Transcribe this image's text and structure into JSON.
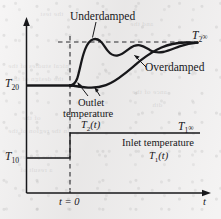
{
  "figure": {
    "axes": {
      "x_axis_label": "t",
      "y_axis_label": "",
      "x_origin_tick_label": "t = 0"
    },
    "labels": {
      "underdamped": "Underdamped",
      "overdamped": "Overdamped",
      "outlet_line1": "Outlet",
      "outlet_line2": "temperature",
      "outlet_symbol_T": "T",
      "outlet_symbol_sub": "2",
      "outlet_symbol_arg": "(t)",
      "inlet_text": "Inlet temperature",
      "inlet_symbol_T": "T",
      "inlet_symbol_sub": "1",
      "inlet_symbol_arg": "(t)",
      "T20_base": "T",
      "T20_sub": "20",
      "T10_base": "T",
      "T10_sub": "10",
      "T2inf_base": "T",
      "T2inf_sub": "2",
      "T2inf_inf": "∞",
      "T1inf_base": "T",
      "T1inf_sub": "1",
      "T1inf_inf": "∞",
      "t_axis": "t",
      "t_zero": "t = 0"
    },
    "colors": {
      "ink": "#17171a",
      "paper": "#ebeae9",
      "dashed": "#2a2a2e",
      "bleed": "#6c6c70"
    }
  },
  "chart_data": {
    "type": "line",
    "xlabel": "t",
    "ylabel": "Temperature",
    "grid": false,
    "legend": "annotations-inline",
    "xlim": [
      -0.18,
      1.0
    ],
    "ylim": [
      0,
      1.0
    ],
    "annotations": [
      {
        "text": "Underdamped",
        "points_to": "underdamped-curve-first-peak"
      },
      {
        "text": "Overdamped",
        "points_to": "overdamped-curve"
      },
      {
        "text": "Outlet temperature T2(t)",
        "points_to": "both-outlet-curves-near-t0"
      },
      {
        "text": "Inlet temperature T1(t)",
        "points_to": "inlet-step-curve"
      },
      {
        "text": "t = 0",
        "points_to": "step-time"
      },
      {
        "text": "T20",
        "points_to": "initial-outlet-temperature"
      },
      {
        "text": "T10",
        "points_to": "initial-inlet-temperature"
      },
      {
        "text": "T2∞",
        "points_to": "final-outlet-temperature"
      },
      {
        "text": "T1∞",
        "points_to": "final-inlet-temperature"
      }
    ],
    "reference_levels": [
      {
        "name": "T20",
        "value": 0.285,
        "style": "solid-left-of-step"
      },
      {
        "name": "T2inf",
        "value": 0.565,
        "style": "dashed"
      },
      {
        "name": "T10",
        "value": 0.095,
        "style": "solid"
      },
      {
        "name": "T1inf",
        "value": 0.225,
        "style": "solid"
      }
    ],
    "step_time": 0.0,
    "series": [
      {
        "name": "Inlet temperature T1(t)",
        "style": "step",
        "x": [
          -0.18,
          0.0,
          0.0,
          1.0
        ],
        "y": [
          0.095,
          0.095,
          0.225,
          0.225
        ]
      },
      {
        "name": "Underdamped outlet temperature",
        "style": "solid-thick",
        "x": [
          -0.18,
          -0.02,
          0.01,
          0.035,
          0.06,
          0.085,
          0.11,
          0.135,
          0.16,
          0.19,
          0.22,
          0.26,
          0.3,
          0.34,
          0.38,
          0.43,
          0.48,
          0.53,
          0.58,
          0.64,
          0.7,
          0.76,
          0.82,
          0.88,
          0.94,
          1.0
        ],
        "y": [
          0.285,
          0.285,
          0.288,
          0.3,
          0.335,
          0.4,
          0.48,
          0.545,
          0.59,
          0.615,
          0.612,
          0.592,
          0.567,
          0.548,
          0.545,
          0.558,
          0.578,
          0.592,
          0.588,
          0.572,
          0.558,
          0.553,
          0.556,
          0.562,
          0.565,
          0.565
        ]
      },
      {
        "name": "Overdamped outlet temperature",
        "style": "solid-thick",
        "x": [
          -0.18,
          -0.02,
          0.02,
          0.06,
          0.1,
          0.15,
          0.2,
          0.26,
          0.32,
          0.38,
          0.44,
          0.5,
          0.56,
          0.62,
          0.68,
          0.74,
          0.8,
          0.86,
          0.92,
          1.0
        ],
        "y": [
          0.285,
          0.285,
          0.284,
          0.281,
          0.278,
          0.278,
          0.286,
          0.305,
          0.333,
          0.368,
          0.406,
          0.444,
          0.48,
          0.51,
          0.533,
          0.549,
          0.558,
          0.563,
          0.565,
          0.565
        ]
      }
    ]
  },
  "bleed_through_lines": [
    {
      "text": "nical studies of the",
      "x": 8,
      "y": 60
    },
    {
      "text": "the design of the",
      "x": 10,
      "y": 73
    },
    {
      "text": "ance of the",
      "x": 132,
      "y": 86
    },
    {
      "text": "dth",
      "x": 152,
      "y": 99
    },
    {
      "text": "of the",
      "x": 22,
      "y": 112
    },
    {
      "text": "in the region of the",
      "x": 8,
      "y": 125
    },
    {
      "text": "of the process",
      "x": 16,
      "y": 151
    },
    {
      "text": "a result of",
      "x": 20,
      "y": 164
    },
    {
      "text": "and the",
      "x": 130,
      "y": 18
    },
    {
      "text": "the test",
      "x": 40,
      "y": 8
    }
  ]
}
